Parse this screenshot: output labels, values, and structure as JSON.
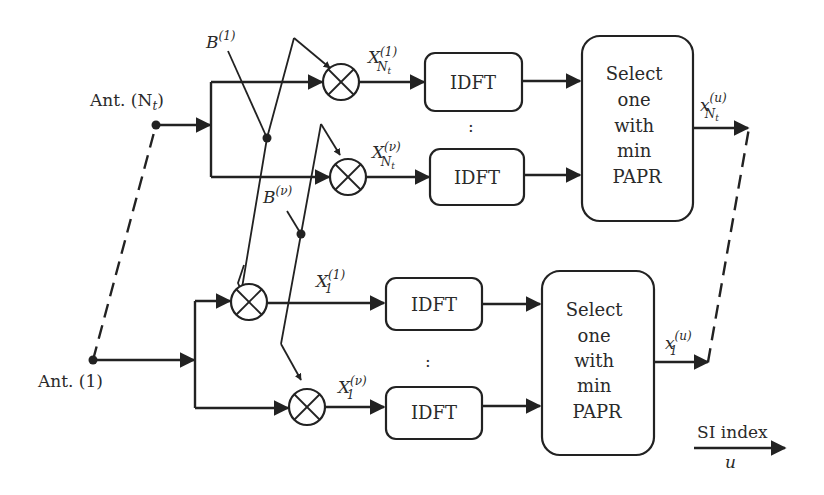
{
  "diagram": {
    "type": "block-diagram",
    "title": "",
    "antennas": [
      {
        "id": "ant-nt",
        "label": "Ant. (N",
        "sub": "t",
        "suffix": ")"
      },
      {
        "id": "ant-1",
        "label": "Ant. (1)"
      }
    ],
    "phase_sequences": [
      {
        "id": "b1",
        "base": "B",
        "sup": "(1)"
      },
      {
        "id": "bv",
        "base": "B",
        "sup": "(ν)"
      }
    ],
    "mixer_outputs": [
      {
        "id": "x-nt-1",
        "base": "X",
        "sub": "N",
        "subsub": "t",
        "sup": "(1)"
      },
      {
        "id": "x-nt-v",
        "base": "X",
        "sub": "N",
        "subsub": "t",
        "sup": "(ν)"
      },
      {
        "id": "x-1-1",
        "base": "X",
        "sub": "1",
        "sup": "(1)"
      },
      {
        "id": "x-1-v",
        "base": "X",
        "sub": "1",
        "sup": "(ν)"
      }
    ],
    "idft_blocks": [
      {
        "id": "idft-nt-1",
        "label": "IDFT"
      },
      {
        "id": "idft-nt-v",
        "label": "IDFT"
      },
      {
        "id": "idft-1-1",
        "label": "IDFT"
      },
      {
        "id": "idft-1-v",
        "label": "IDFT"
      }
    ],
    "selectors": [
      {
        "id": "sel-nt",
        "lines": [
          "Select",
          "one",
          "with",
          "min",
          "PAPR"
        ]
      },
      {
        "id": "sel-1",
        "lines": [
          "Select",
          "one",
          "with",
          "min",
          "PAPR"
        ]
      }
    ],
    "outputs": [
      {
        "id": "out-nt",
        "base": "x",
        "sub": "N",
        "subsub": "t",
        "sup": "(u)"
      },
      {
        "id": "out-1",
        "base": "x",
        "sub": "1",
        "sup": "(u)"
      }
    ],
    "ellipsis": ":",
    "side_info": {
      "label": "SI index",
      "var": "u"
    }
  }
}
